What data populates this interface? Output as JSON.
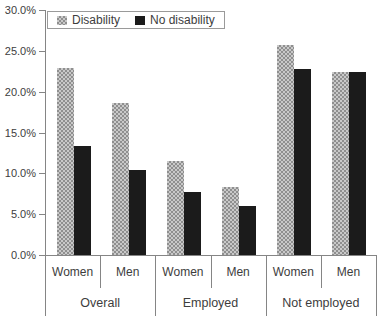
{
  "chart_data": {
    "type": "bar",
    "title": "",
    "xlabel": "",
    "ylabel": "",
    "ylim": [
      0,
      30
    ],
    "grid": false,
    "legend_position": "top-left",
    "ytick_labels": [
      "30.0%",
      "25.0%",
      "20.0%",
      "15.0%",
      "10.0%",
      "5.0%",
      "0.0%"
    ],
    "ytick_values": [
      30,
      25,
      20,
      15,
      10,
      5,
      0
    ],
    "series_names": [
      "Disability",
      "No disability"
    ],
    "legend": [
      {
        "name": "Disability",
        "style": "checkered-gray"
      },
      {
        "name": "No disability",
        "style": "solid-black"
      }
    ],
    "groups": [
      {
        "label": "Overall",
        "bars": [
          {
            "label": "Women",
            "disability": 22.9,
            "no_disability": 13.4
          },
          {
            "label": "Men",
            "disability": 18.6,
            "no_disability": 10.4
          }
        ]
      },
      {
        "label": "Employed",
        "bars": [
          {
            "label": "Women",
            "disability": 11.5,
            "no_disability": 7.7
          },
          {
            "label": "Men",
            "disability": 8.3,
            "no_disability": 6.0
          }
        ]
      },
      {
        "label": "Not employed",
        "bars": [
          {
            "label": "Women",
            "disability": 25.7,
            "no_disability": 22.8
          },
          {
            "label": "Men",
            "disability": 22.4,
            "no_disability": 22.4
          }
        ]
      }
    ],
    "colors": {
      "bar_gray_light": "#c9c9c9",
      "bar_gray_dark": "#8f8f8f",
      "bar_black": "#1b1b1b",
      "axis_line": "#858585",
      "text": "#3d3d3d",
      "background": "#ffffff"
    }
  }
}
